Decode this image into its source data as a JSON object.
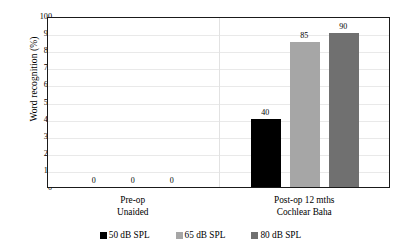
{
  "chart_data": {
    "type": "bar",
    "title": "",
    "xlabel": "",
    "ylabel": "Word  recognition  (%)",
    "ylim": [
      0,
      100
    ],
    "ytick_step": 10,
    "ytick_labels": [
      "100",
      "90",
      "80",
      "70",
      "60",
      "50",
      "40",
      "30",
      "20",
      "10",
      "0"
    ],
    "grid": true,
    "legend_position": "bottom",
    "categories": [
      "Pre-op\nUnaided",
      "Post-op 12 mths\nCochlear Baha"
    ],
    "category_lines": [
      {
        "line1": "Pre-op",
        "line2": "Unaided"
      },
      {
        "line1": "Post-op 12 mths",
        "line2": "Cochlear Baha"
      }
    ],
    "series": [
      {
        "name": "50 dB SPL",
        "color": "#000000",
        "values": [
          0,
          40
        ]
      },
      {
        "name": "65 dB SPL",
        "color": "#a6a6a6",
        "values": [
          0,
          85
        ]
      },
      {
        "name": "80 dB SPL",
        "color": "#707070",
        "values": [
          0,
          90
        ]
      }
    ],
    "data_labels": {
      "group_0": [
        "0",
        "0",
        "0"
      ],
      "group_1": [
        "40",
        "85",
        "90"
      ]
    }
  },
  "legend": {
    "items": [
      {
        "label": "50 dB SPL",
        "color": "#000000",
        "swatch": "square-swatch"
      },
      {
        "label": "65 dB SPL",
        "color": "#a6a6a6",
        "swatch": "square-swatch"
      },
      {
        "label": "80 dB SPL",
        "color": "#707070",
        "swatch": "square-swatch"
      }
    ]
  }
}
